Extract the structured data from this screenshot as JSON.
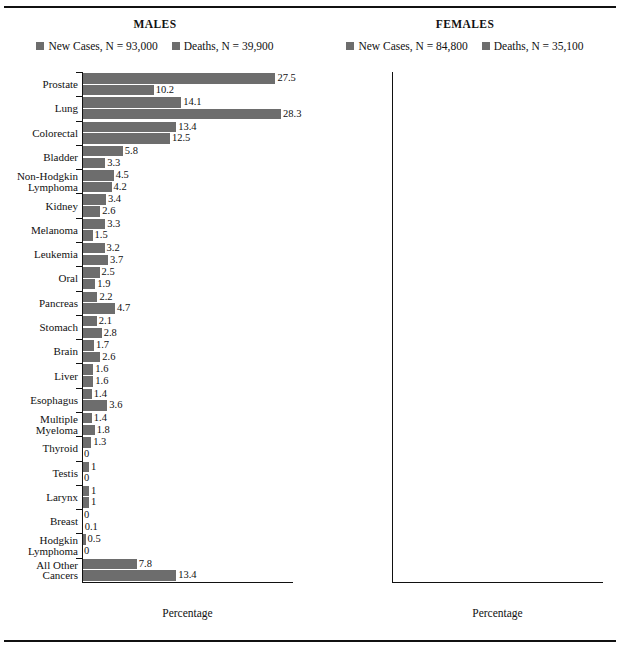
{
  "figure": {
    "axis": {
      "xlabel": "Percentage",
      "ticks": [
        0,
        5,
        10,
        15,
        20,
        25,
        30
      ],
      "xlim": [
        0,
        30
      ]
    },
    "colors": {
      "bar": "#6d6d6d",
      "text": "#111111",
      "background": "#ffffff"
    }
  },
  "chart_data": {
    "type": "bar",
    "title": "",
    "xlabel": "Percentage",
    "ylabel": "",
    "xlim": [
      0,
      30
    ],
    "grid": false,
    "orientation": "horizontal",
    "legend_position": "top-center",
    "panels": [
      {
        "id": "males",
        "title": "MALES",
        "legend": [
          {
            "label": "New Cases, N = 93,000",
            "swatch": "#6d6d6d"
          },
          {
            "label": "Deaths, N = 39,900",
            "swatch": "#6d6d6d"
          }
        ],
        "series": [
          {
            "name": "New Cases, N = 93,000"
          },
          {
            "name": "Deaths, N = 39,900"
          }
        ],
        "categories": [
          "Prostate",
          "Lung",
          "Colorectal",
          "Bladder",
          "Non-Hodgkin\nLymphoma",
          "Kidney",
          "Melanoma",
          "Leukemia",
          "Oral",
          "Pancreas",
          "Stomach",
          "Brain",
          "Liver",
          "Esophagus",
          "Multiple\nMyeloma",
          "Thyroid",
          "Testis",
          "Larynx",
          "Breast",
          "Hodgkin\nLymphoma",
          "All Other\nCancers"
        ],
        "new_cases": [
          27.5,
          14.1,
          13.4,
          5.8,
          4.5,
          3.4,
          3.3,
          3.2,
          2.5,
          2.2,
          2.1,
          1.7,
          1.6,
          1.4,
          1.4,
          1.3,
          1,
          1,
          0,
          0.5,
          7.8
        ],
        "deaths": [
          10.2,
          28.3,
          12.5,
          3.3,
          4.2,
          2.6,
          1.5,
          3.7,
          1.9,
          4.7,
          2.8,
          2.6,
          1.6,
          3.6,
          1.8,
          0,
          0,
          1,
          0.1,
          0,
          13.4
        ],
        "new_cases_labels": [
          "27.5",
          "14.1",
          "13.4",
          "5.8",
          "4.5",
          "3.4",
          "3.3",
          "3.2",
          "2.5",
          "2.2",
          "2.1",
          "1.7",
          "1.6",
          "1.4",
          "1.4",
          "1.3",
          "1",
          "1",
          "0",
          "0.5",
          "7.8"
        ],
        "deaths_labels": [
          "10.2",
          "28.3",
          "12.5",
          "3.3",
          "4.2",
          "2.6",
          "1.5",
          "3.7",
          "1.9",
          "4.7",
          "2.8",
          "2.6",
          "1.6",
          "3.6",
          "1.8",
          "0",
          "0",
          "1",
          "0.1",
          "0",
          "13.4"
        ]
      },
      {
        "id": "females",
        "title": "FEMALES",
        "legend": [
          {
            "label": "New Cases, N = 84,800",
            "swatch": "#6d6d6d"
          },
          {
            "label": "Deaths, N = 35,100",
            "swatch": "#6d6d6d"
          }
        ],
        "series": [
          {
            "name": "New Cases, N = 84,800"
          },
          {
            "name": "Deaths, N = 35,100"
          }
        ],
        "categories": [
          "Breast",
          "Lung",
          "Colorectal",
          "Body of Uterus",
          "Thyroid",
          "Non-Hodgkin\nLymphoma",
          "Ovary",
          "Melanoma",
          "Pancreas",
          "Leukemia",
          "Kidney",
          "Bladder",
          "Cervix",
          "Oral",
          "Brain",
          "Stomach",
          "Multiple\nMyeloma",
          "Liver",
          "Hodgkin\nLymphoma",
          "Esophagus",
          "Larynx",
          "All Other\nCancers"
        ],
        "new_cases": [
          27.6,
          14.4,
          11.4,
          5.6,
          5.3,
          4.1,
          3,
          2.9,
          2.4,
          2.4,
          2.3,
          2.1,
          1.5,
          1.4,
          1.4,
          1.2,
          1.2,
          0.5,
          0.5,
          0.5,
          0.2,
          8
        ],
        "deaths": [
          14.4,
          26.7,
          11.1,
          2.1,
          0,
          3.8,
          4.9,
          1,
          5.6,
          2.8,
          1.7,
          1.5,
          1,
          1.1,
          2.1,
          1.9,
          1.8,
          0.5,
          0,
          1.2,
          0.3,
          14.5
        ],
        "new_cases_labels": [
          "27.6",
          "14.4",
          "11.4",
          "5.6",
          "5.3",
          "4.1",
          "3",
          "2.9",
          "2.4",
          "2.4",
          "2.3",
          "2.1",
          "1.5",
          "1.4",
          "1.4",
          "1.2",
          "1.2",
          "0.5",
          "0.5",
          "0.5",
          "0.2",
          "8"
        ],
        "deaths_labels": [
          "14.4",
          "26.7",
          "11.1",
          "2.1",
          "0",
          "3.8",
          "4.9",
          "1",
          "5.6",
          "2.8",
          "1.7",
          "1.5",
          "1",
          "1.1",
          "2.1",
          "1.9",
          "1.8",
          "0.5",
          "0",
          "1.2",
          "0.3",
          "14.5"
        ]
      }
    ]
  }
}
